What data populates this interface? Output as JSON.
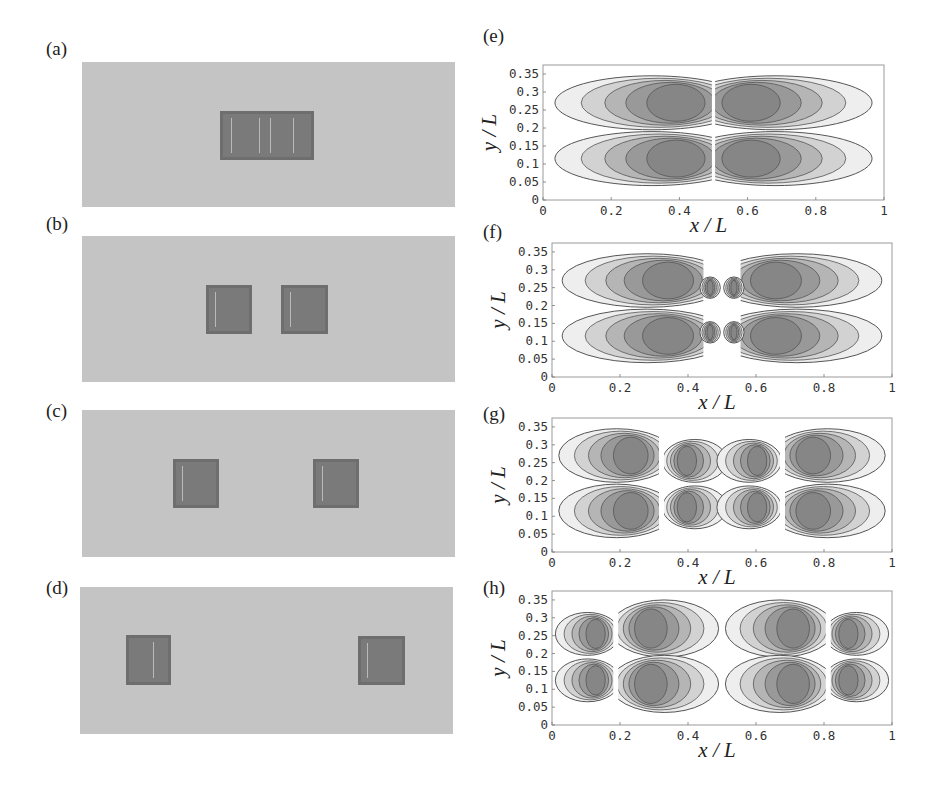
{
  "figure": {
    "left_panels": [
      {
        "label": "(a)",
        "x": 82,
        "y": 62,
        "w": 373,
        "h": 145,
        "blocks": [
          {
            "x": 220,
            "y": 111,
            "w": 94,
            "h": 49,
            "marks": [
              0.12,
              0.42,
              0.53,
              0.78
            ]
          }
        ]
      },
      {
        "label": "(b)",
        "x": 82,
        "y": 236,
        "w": 373,
        "h": 146,
        "blocks": [
          {
            "x": 206,
            "y": 285,
            "w": 46,
            "h": 49,
            "marks": [
              0.2
            ]
          },
          {
            "x": 281,
            "y": 285,
            "w": 47,
            "h": 49,
            "marks": [
              0.2
            ]
          }
        ]
      },
      {
        "label": "(c)",
        "x": 82,
        "y": 410,
        "w": 373,
        "h": 147,
        "blocks": [
          {
            "x": 173,
            "y": 459,
            "w": 46,
            "h": 49,
            "marks": [
              0.2
            ]
          },
          {
            "x": 313,
            "y": 459,
            "w": 46,
            "h": 49,
            "marks": [
              0.2
            ]
          }
        ]
      },
      {
        "label": "(d)",
        "x": 80,
        "y": 587,
        "w": 373,
        "h": 147,
        "blocks": [
          {
            "x": 126,
            "y": 635,
            "w": 45,
            "h": 50,
            "marks": [
              0.6
            ]
          },
          {
            "x": 358,
            "y": 636,
            "w": 47,
            "h": 49,
            "marks": [
              0.2
            ]
          }
        ]
      }
    ],
    "label_positions": [
      {
        "x": 46,
        "y": 38
      },
      {
        "x": 46,
        "y": 213
      },
      {
        "x": 46,
        "y": 400
      },
      {
        "x": 46,
        "y": 577
      }
    ],
    "contour_colors": [
      "#eeeeee",
      "#d2d2d2",
      "#b5b5b5",
      "#999999",
      "#868686"
    ],
    "edge_color": "#555555"
  },
  "chart_data": [
    {
      "type": "heatmap",
      "panel": "(e)",
      "xlabel": "x / L",
      "ylabel": "y / L",
      "xlim": [
        0,
        1
      ],
      "ylim": [
        0,
        0.375
      ],
      "xticks": [
        "0",
        "0.2",
        "0.4",
        "0.6",
        "0.8",
        "1"
      ],
      "yticks": [
        "0",
        "0.05",
        "0.1",
        "0.15",
        "0.2",
        "0.25",
        "0.3",
        "0.35"
      ],
      "frame": {
        "x": 543,
        "y": 65,
        "w": 341,
        "h": 135
      },
      "label_pos": {
        "x": 483,
        "y": 24
      },
      "lobes": [
        {
          "cx": 0.32,
          "cy": 0.27,
          "rx": 0.285,
          "ry": 0.075,
          "open": "right",
          "edge": 0.495
        },
        {
          "cx": 0.32,
          "cy": 0.115,
          "rx": 0.285,
          "ry": 0.075,
          "open": "right",
          "edge": 0.495
        },
        {
          "cx": 0.68,
          "cy": 0.27,
          "rx": 0.285,
          "ry": 0.075,
          "open": "left",
          "edge": 0.505
        },
        {
          "cx": 0.68,
          "cy": 0.115,
          "rx": 0.285,
          "ry": 0.075,
          "open": "left",
          "edge": 0.505
        }
      ]
    },
    {
      "type": "heatmap",
      "panel": "(f)",
      "xlabel": "x / L",
      "ylabel": "y / L",
      "xlim": [
        0,
        1
      ],
      "ylim": [
        0,
        0.375
      ],
      "xticks": [
        "0",
        "0.2",
        "0.4",
        "0.6",
        "0.8",
        "1"
      ],
      "yticks": [
        "0",
        "0.05",
        "0.1",
        "0.15",
        "0.2",
        "0.25",
        "0.3",
        "0.35"
      ],
      "frame": {
        "x": 552,
        "y": 243,
        "w": 340,
        "h": 134
      },
      "label_pos": {
        "x": 483,
        "y": 220
      },
      "lobes": [
        {
          "cx": 0.28,
          "cy": 0.27,
          "rx": 0.25,
          "ry": 0.075,
          "open": "right",
          "edge": 0.445
        },
        {
          "cx": 0.28,
          "cy": 0.115,
          "rx": 0.25,
          "ry": 0.075,
          "open": "right",
          "edge": 0.445
        },
        {
          "cx": 0.72,
          "cy": 0.27,
          "rx": 0.25,
          "ry": 0.075,
          "open": "left",
          "edge": 0.555
        },
        {
          "cx": 0.72,
          "cy": 0.115,
          "rx": 0.25,
          "ry": 0.075,
          "open": "left",
          "edge": 0.555
        },
        {
          "cx": 0.465,
          "cy": 0.25,
          "rx": 0.03,
          "ry": 0.03,
          "open": "none",
          "edge": 0
        },
        {
          "cx": 0.535,
          "cy": 0.25,
          "rx": 0.03,
          "ry": 0.03,
          "open": "none",
          "edge": 0
        },
        {
          "cx": 0.465,
          "cy": 0.125,
          "rx": 0.03,
          "ry": 0.03,
          "open": "none",
          "edge": 0
        },
        {
          "cx": 0.535,
          "cy": 0.125,
          "rx": 0.03,
          "ry": 0.03,
          "open": "none",
          "edge": 0
        }
      ]
    },
    {
      "type": "heatmap",
      "panel": "(g)",
      "xlabel": "x / L",
      "ylabel": "y / L",
      "xlim": [
        0,
        1
      ],
      "ylim": [
        0,
        0.375
      ],
      "xticks": [
        "0",
        "0.2",
        "0.4",
        "0.6",
        "0.8",
        "1"
      ],
      "yticks": [
        "0",
        "0.05",
        "0.1",
        "0.15",
        "0.2",
        "0.25",
        "0.3",
        "0.35"
      ],
      "frame": {
        "x": 552,
        "y": 418,
        "w": 340,
        "h": 134
      },
      "label_pos": {
        "x": 483,
        "y": 402
      },
      "lobes": [
        {
          "cx": 0.19,
          "cy": 0.27,
          "rx": 0.17,
          "ry": 0.075,
          "open": "right",
          "edge": 0.315
        },
        {
          "cx": 0.19,
          "cy": 0.115,
          "rx": 0.17,
          "ry": 0.075,
          "open": "right",
          "edge": 0.315
        },
        {
          "cx": 0.42,
          "cy": 0.255,
          "rx": 0.095,
          "ry": 0.06,
          "open": "left",
          "edge": 0.33
        },
        {
          "cx": 0.42,
          "cy": 0.125,
          "rx": 0.095,
          "ry": 0.06,
          "open": "left",
          "edge": 0.33
        },
        {
          "cx": 0.58,
          "cy": 0.255,
          "rx": 0.095,
          "ry": 0.06,
          "open": "right",
          "edge": 0.67
        },
        {
          "cx": 0.58,
          "cy": 0.125,
          "rx": 0.095,
          "ry": 0.06,
          "open": "right",
          "edge": 0.67
        },
        {
          "cx": 0.81,
          "cy": 0.27,
          "rx": 0.17,
          "ry": 0.075,
          "open": "left",
          "edge": 0.685
        },
        {
          "cx": 0.81,
          "cy": 0.115,
          "rx": 0.17,
          "ry": 0.075,
          "open": "left",
          "edge": 0.685
        }
      ]
    },
    {
      "type": "heatmap",
      "panel": "(h)",
      "xlabel": "x / L",
      "ylabel": "y / L",
      "xlim": [
        0,
        1
      ],
      "ylim": [
        0,
        0.375
      ],
      "xticks": [
        "0",
        "0.2",
        "0.4",
        "0.6",
        "0.8",
        "1"
      ],
      "yticks": [
        "0",
        "0.05",
        "0.1",
        "0.15",
        "0.2",
        "0.25",
        "0.3",
        "0.35"
      ],
      "frame": {
        "x": 552,
        "y": 591,
        "w": 340,
        "h": 134
      },
      "label_pos": {
        "x": 483,
        "y": 576
      },
      "lobes": [
        {
          "cx": 0.105,
          "cy": 0.255,
          "rx": 0.095,
          "ry": 0.06,
          "open": "right",
          "edge": 0.18
        },
        {
          "cx": 0.105,
          "cy": 0.125,
          "rx": 0.095,
          "ry": 0.06,
          "open": "right",
          "edge": 0.18
        },
        {
          "cx": 0.33,
          "cy": 0.27,
          "rx": 0.16,
          "ry": 0.08,
          "open": "left",
          "edge": 0.195
        },
        {
          "cx": 0.33,
          "cy": 0.115,
          "rx": 0.16,
          "ry": 0.08,
          "open": "left",
          "edge": 0.195
        },
        {
          "cx": 0.67,
          "cy": 0.27,
          "rx": 0.16,
          "ry": 0.08,
          "open": "right",
          "edge": 0.805
        },
        {
          "cx": 0.67,
          "cy": 0.115,
          "rx": 0.16,
          "ry": 0.08,
          "open": "right",
          "edge": 0.805
        },
        {
          "cx": 0.895,
          "cy": 0.255,
          "rx": 0.095,
          "ry": 0.06,
          "open": "left",
          "edge": 0.82
        },
        {
          "cx": 0.895,
          "cy": 0.125,
          "rx": 0.095,
          "ry": 0.06,
          "open": "left",
          "edge": 0.82
        }
      ]
    }
  ]
}
